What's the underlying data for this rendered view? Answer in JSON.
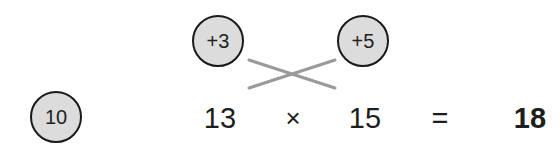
{
  "diagram": {
    "type": "mental-math-multiplication-trick",
    "base_circle": {
      "label": "10"
    },
    "offset_circles": [
      {
        "label": "+3"
      },
      {
        "label": "+5"
      }
    ],
    "cross_lines_color": "#9a9a9a",
    "equation": {
      "left_operand": "13",
      "operator": "×",
      "right_operand": "15",
      "equals": "=",
      "result": "18"
    },
    "colors": {
      "circle_fill": "#dcdcdc",
      "circle_stroke": "#1a1a1a",
      "text": "#1e1e1e",
      "background": "#ffffff"
    }
  }
}
